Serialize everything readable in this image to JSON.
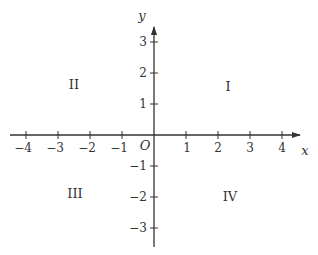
{
  "diagram": {
    "type": "cartesian-coordinate-plane",
    "colors": {
      "axis": "#333333",
      "text": "#333333",
      "background": "#ffffff"
    },
    "axes": {
      "x": {
        "label": "x",
        "ticks": [
          "−4",
          "−3",
          "−2",
          "−1",
          "1",
          "2",
          "3",
          "4"
        ],
        "tick_values": [
          -4,
          -3,
          -2,
          -1,
          1,
          2,
          3,
          4
        ]
      },
      "y": {
        "label": "y",
        "ticks": [
          "3",
          "2",
          "1",
          "−1",
          "−2",
          "−3"
        ],
        "tick_values": [
          3,
          2,
          1,
          -1,
          -2,
          -3
        ]
      },
      "origin_label": "O"
    },
    "quadrants": {
      "q1": "I",
      "q2": "II",
      "q3": "III",
      "q4": "IV"
    }
  }
}
